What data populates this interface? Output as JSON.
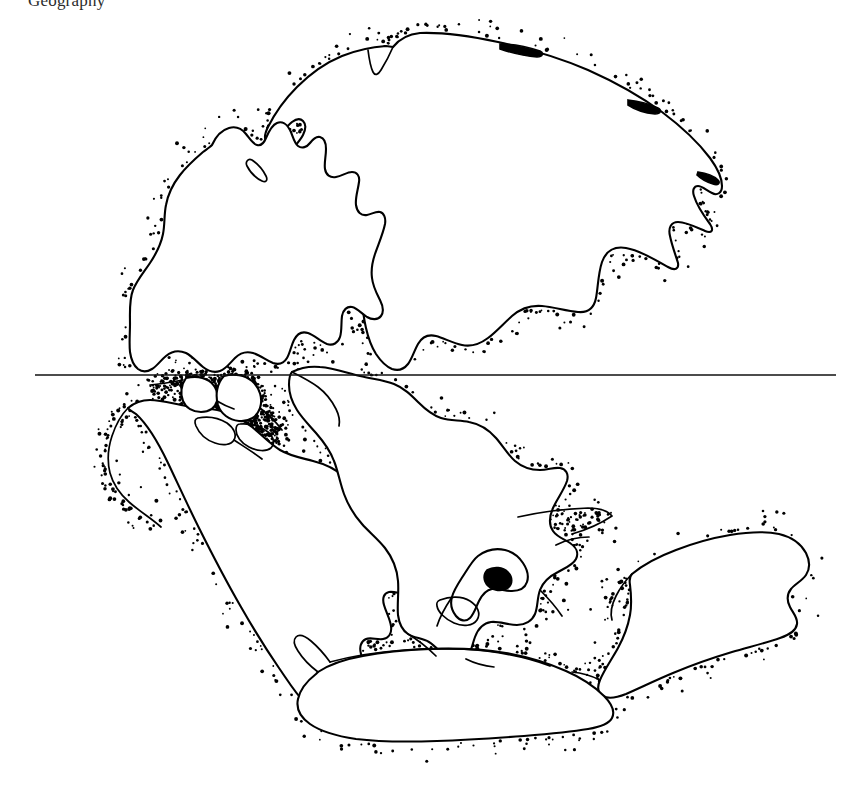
{
  "figure": {
    "caption_partial": "Geography",
    "domain_label": "paleogeographic-map",
    "background_color": "#ffffff",
    "ink_color": "#000000",
    "width_px": 860,
    "height_px": 796
  },
  "map": {
    "title": "Pangaea Reconstruction",
    "style": "stippled pen-and-ink line drawing",
    "equator": {
      "label": "equator",
      "y_px": 375,
      "x_start_px": 35,
      "x_end_px": 836,
      "color": "#111111"
    },
    "landmasses": [
      {
        "name": "laurasia-eurasia",
        "label": "Laurasia / Eurasia",
        "hemisphere": "north"
      },
      {
        "name": "north-america",
        "label": "North America",
        "hemisphere": "north"
      },
      {
        "name": "south-america",
        "label": "South America",
        "hemisphere": "south"
      },
      {
        "name": "africa",
        "label": "Africa",
        "hemisphere": "south"
      },
      {
        "name": "india-madagascar",
        "label": "India / Madagascar",
        "hemisphere": "south"
      },
      {
        "name": "australia",
        "label": "Australia",
        "hemisphere": "south"
      },
      {
        "name": "antarctica",
        "label": "Antarctica",
        "hemisphere": "south"
      },
      {
        "name": "central-island-blocks",
        "label": "Central island blocks",
        "hemisphere": "equatorial"
      }
    ]
  },
  "chart_data": {
    "type": "map",
    "xlabel": "",
    "ylabel": "",
    "annotations": [
      "equator"
    ],
    "categories": [
      "Laurasia / Eurasia",
      "North America",
      "South America",
      "Africa",
      "India / Madagascar",
      "Australia",
      "Antarctica",
      "Central island blocks"
    ]
  }
}
